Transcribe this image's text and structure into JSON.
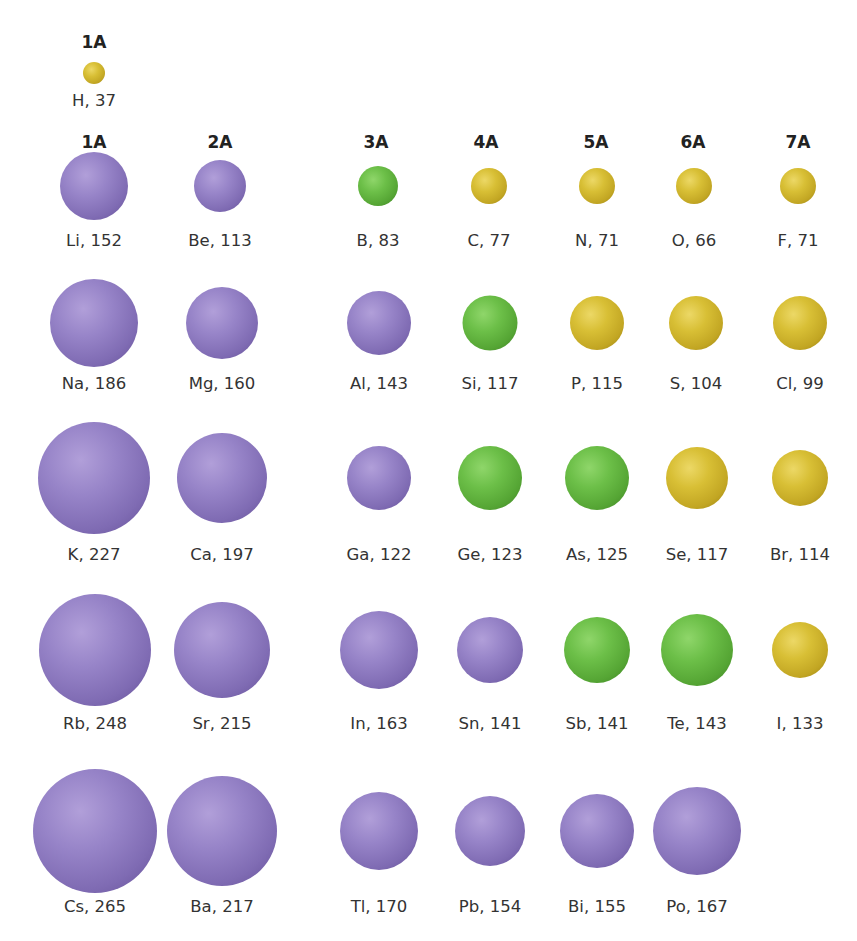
{
  "hydrogen": {
    "group": "1A",
    "symbol": "H",
    "radius_pm": 37,
    "label": "H, 37",
    "category": "nonmetal",
    "x": 94,
    "y": 73,
    "d": 22
  },
  "group_headers": [
    {
      "label": "1A",
      "x": 94
    },
    {
      "label": "2A",
      "x": 220
    },
    {
      "label": "3A",
      "x": 376
    },
    {
      "label": "4A",
      "x": 486
    },
    {
      "label": "5A",
      "x": 596
    },
    {
      "label": "6A",
      "x": 693
    },
    {
      "label": "7A",
      "x": 798
    }
  ],
  "colors": {
    "metal": "#8e7bc0",
    "metalloid": "#63b43f",
    "nonmetal": "#d2b82f"
  },
  "rows": [
    {
      "period": 2,
      "cy": 186,
      "ly": 240,
      "elements": [
        {
          "label": "Li, 152",
          "symbol": "Li",
          "r": 152,
          "cat": "metal",
          "x": 94,
          "d": 68
        },
        {
          "label": "Be, 113",
          "symbol": "Be",
          "r": 113,
          "cat": "metal",
          "x": 220,
          "d": 52
        },
        {
          "label": "B, 83",
          "symbol": "B",
          "r": 83,
          "cat": "metalloid",
          "x": 378,
          "d": 40
        },
        {
          "label": "C, 77",
          "symbol": "C",
          "r": 77,
          "cat": "nonmetal",
          "x": 489,
          "d": 36
        },
        {
          "label": "N, 71",
          "symbol": "N",
          "r": 71,
          "cat": "nonmetal",
          "x": 597,
          "d": 36
        },
        {
          "label": "O, 66",
          "symbol": "O",
          "r": 66,
          "cat": "nonmetal",
          "x": 694,
          "d": 36
        },
        {
          "label": "F, 71",
          "symbol": "F",
          "r": 71,
          "cat": "nonmetal",
          "x": 798,
          "d": 36
        }
      ]
    },
    {
      "period": 3,
      "cy": 323,
      "ly": 383,
      "elements": [
        {
          "label": "Na, 186",
          "symbol": "Na",
          "r": 186,
          "cat": "metal",
          "x": 94,
          "d": 88
        },
        {
          "label": "Mg, 160",
          "symbol": "Mg",
          "r": 160,
          "cat": "metal",
          "x": 222,
          "d": 72
        },
        {
          "label": "Al, 143",
          "symbol": "Al",
          "r": 143,
          "cat": "metal",
          "x": 379,
          "d": 64
        },
        {
          "label": "Si, 117",
          "symbol": "Si",
          "r": 117,
          "cat": "metalloid",
          "x": 490,
          "d": 55
        },
        {
          "label": "P, 115",
          "symbol": "P",
          "r": 115,
          "cat": "nonmetal",
          "x": 597,
          "d": 54
        },
        {
          "label": "S, 104",
          "symbol": "S",
          "r": 104,
          "cat": "nonmetal",
          "x": 696,
          "d": 54
        },
        {
          "label": "Cl, 99",
          "symbol": "Cl",
          "r": 99,
          "cat": "nonmetal",
          "x": 800,
          "d": 54
        }
      ]
    },
    {
      "period": 4,
      "cy": 478,
      "ly": 554,
      "elements": [
        {
          "label": "K, 227",
          "symbol": "K",
          "r": 227,
          "cat": "metal",
          "x": 94,
          "d": 112
        },
        {
          "label": "Ca, 197",
          "symbol": "Ca",
          "r": 197,
          "cat": "metal",
          "x": 222,
          "d": 90
        },
        {
          "label": "Ga, 122",
          "symbol": "Ga",
          "r": 122,
          "cat": "metal",
          "x": 379,
          "d": 64
        },
        {
          "label": "Ge, 123",
          "symbol": "Ge",
          "r": 123,
          "cat": "metalloid",
          "x": 490,
          "d": 64
        },
        {
          "label": "As, 125",
          "symbol": "As",
          "r": 125,
          "cat": "metalloid",
          "x": 597,
          "d": 64
        },
        {
          "label": "Se, 117",
          "symbol": "Se",
          "r": 117,
          "cat": "nonmetal",
          "x": 697,
          "d": 62
        },
        {
          "label": "Br, 114",
          "symbol": "Br",
          "r": 114,
          "cat": "nonmetal",
          "x": 800,
          "d": 56
        }
      ]
    },
    {
      "period": 5,
      "cy": 650,
      "ly": 723,
      "elements": [
        {
          "label": "Rb, 248",
          "symbol": "Rb",
          "r": 248,
          "cat": "metal",
          "x": 95,
          "d": 112
        },
        {
          "label": "Sr, 215",
          "symbol": "Sr",
          "r": 215,
          "cat": "metal",
          "x": 222,
          "d": 96
        },
        {
          "label": "In, 163",
          "symbol": "In",
          "r": 163,
          "cat": "metal",
          "x": 379,
          "d": 78
        },
        {
          "label": "Sn, 141",
          "symbol": "Sn",
          "r": 141,
          "cat": "metal",
          "x": 490,
          "d": 66
        },
        {
          "label": "Sb, 141",
          "symbol": "Sb",
          "r": 141,
          "cat": "metalloid",
          "x": 597,
          "d": 66
        },
        {
          "label": "Te, 143",
          "symbol": "Te",
          "r": 143,
          "cat": "metalloid",
          "x": 697,
          "d": 72
        },
        {
          "label": "I, 133",
          "symbol": "I",
          "r": 133,
          "cat": "nonmetal",
          "x": 800,
          "d": 56
        }
      ]
    },
    {
      "period": 6,
      "cy": 831,
      "ly": 906,
      "elements": [
        {
          "label": "Cs, 265",
          "symbol": "Cs",
          "r": 265,
          "cat": "metal",
          "x": 95,
          "d": 124
        },
        {
          "label": "Ba, 217",
          "symbol": "Ba",
          "r": 217,
          "cat": "metal",
          "x": 222,
          "d": 110
        },
        {
          "label": "Tl, 170",
          "symbol": "Tl",
          "r": 170,
          "cat": "metal",
          "x": 379,
          "d": 78
        },
        {
          "label": "Pb, 154",
          "symbol": "Pb",
          "r": 154,
          "cat": "metal",
          "x": 490,
          "d": 70
        },
        {
          "label": "Bi, 155",
          "symbol": "Bi",
          "r": 155,
          "cat": "metal",
          "x": 597,
          "d": 74
        },
        {
          "label": "Po, 167",
          "symbol": "Po",
          "r": 167,
          "cat": "metal",
          "x": 697,
          "d": 88
        }
      ]
    }
  ]
}
